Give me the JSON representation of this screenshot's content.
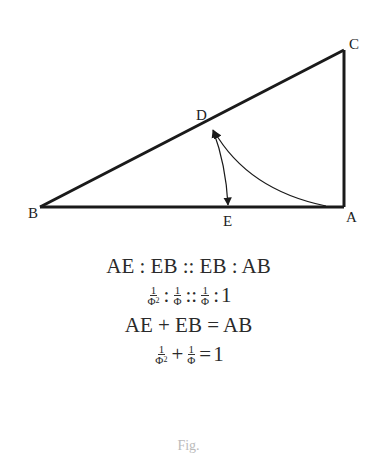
{
  "diagram": {
    "points": {
      "A": {
        "label": "A",
        "x": 344,
        "y": 207
      },
      "B": {
        "label": "B",
        "x": 40,
        "y": 207
      },
      "C": {
        "label": "C",
        "x": 344,
        "y": 50
      },
      "D": {
        "label": "D",
        "x": 210,
        "y": 123
      },
      "E": {
        "label": "E",
        "x": 229,
        "y": 207
      }
    },
    "stroke_color": "#1a1a1a"
  },
  "equations": {
    "line1": "AE : EB :: EB : AB",
    "line2": {
      "t1_num": "1",
      "t1_den": "Φ",
      "t1_exp": "2",
      "sep1": ":",
      "t2_num": "1",
      "t2_den": "Φ",
      "sep2": "::",
      "t3_num": "1",
      "t3_den": "Φ",
      "sep3": ":",
      "rhs": "1"
    },
    "line3": "AE + EB = AB",
    "line4": {
      "t1_num": "1",
      "t1_den": "Φ",
      "t1_exp": "2",
      "op": "+",
      "t2_num": "1",
      "t2_den": "Φ",
      "eq": "=",
      "rhs": "1"
    }
  },
  "footer": {
    "caption": "Fig."
  }
}
